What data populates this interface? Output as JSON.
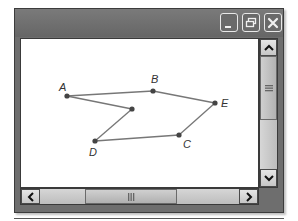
{
  "window": {
    "title": "",
    "controls": {
      "minimize": "minimize-icon",
      "restore": "restore-icon",
      "close": "close-icon"
    },
    "colors": {
      "frame": "#6e6e6e",
      "content_bg": "#ffffff",
      "point": "#444444",
      "line": "#777777"
    }
  },
  "canvas": {
    "points": [
      {
        "label": "A",
        "x": 46,
        "y": 57,
        "lx": 38,
        "ly": 52
      },
      {
        "label": "B",
        "x": 132,
        "y": 52,
        "lx": 130,
        "ly": 44
      },
      {
        "label": "E",
        "x": 194,
        "y": 64,
        "lx": 200,
        "ly": 68
      },
      {
        "label": "C",
        "x": 158,
        "y": 96,
        "lx": 162,
        "ly": 109
      },
      {
        "label": "D",
        "x": 74,
        "y": 102,
        "lx": 68,
        "ly": 117
      },
      {
        "label": "",
        "x": 111,
        "y": 70,
        "lx": 0,
        "ly": 0
      }
    ],
    "segments": [
      [
        "A",
        "B"
      ],
      [
        "B",
        "E"
      ],
      [
        "E",
        "C"
      ],
      [
        "C",
        "D"
      ],
      [
        "D",
        "P"
      ],
      [
        "P",
        "A"
      ]
    ]
  },
  "scrollbars": {
    "vertical": {
      "up": "chevron-up-icon",
      "down": "chevron-down-icon",
      "thumb_grip": "grip-horizontal-icon"
    },
    "horizontal": {
      "left": "chevron-left-icon",
      "right": "chevron-right-icon",
      "thumb_grip": "grip-vertical-icon"
    }
  }
}
